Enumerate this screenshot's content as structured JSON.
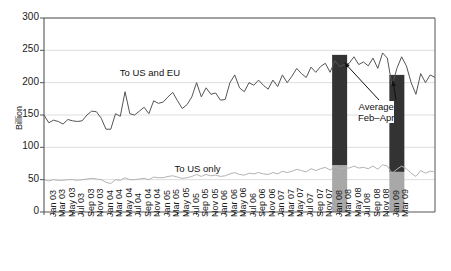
{
  "chart_data": {
    "type": "line",
    "title": "",
    "xlabel": "",
    "ylabel": "Billion",
    "ylim": [
      0,
      300
    ],
    "yticks": [
      0,
      50,
      100,
      150,
      200,
      250,
      300
    ],
    "grid": true,
    "legend_position": "inline-annotation",
    "x_tick_step_months": 2,
    "x": [
      "Jan 03",
      "Mar 03",
      "May 03",
      "Jul 03",
      "Sep 03",
      "Nov 03",
      "Jan 04",
      "Mar 04",
      "May 04",
      "Jul 04",
      "Sep 04",
      "Nov 04",
      "Jan 05",
      "Mar 05",
      "May 05",
      "Jul 05",
      "Sep 05",
      "Nov 05",
      "Jan 06",
      "Mar 06",
      "May 06",
      "Jul 06",
      "Sep 06",
      "Nov 06",
      "Jan 07",
      "Mar 07",
      "May 07",
      "Jul 07",
      "Sep 07",
      "Nov 07",
      "Jan 08",
      "Mar 08",
      "May 08",
      "Jul 08",
      "Sep 08",
      "Nov 08",
      "Jan 09",
      "Mar 09"
    ],
    "series": [
      {
        "name": "To US and EU",
        "color": "#555555",
        "label_x": "Jul 04",
        "monthly_values": [
          150,
          138,
          142,
          140,
          136,
          143,
          141,
          140,
          141,
          150,
          156,
          155,
          145,
          128,
          128,
          152,
          148,
          186,
          152,
          150,
          156,
          162,
          152,
          172,
          168,
          170,
          178,
          185,
          172,
          160,
          166,
          178,
          200,
          178,
          192,
          182,
          184,
          173,
          174,
          200,
          212,
          192,
          186,
          200,
          196,
          204,
          196,
          190,
          204,
          194,
          212,
          200,
          210,
          222,
          214,
          208,
          224,
          216,
          225,
          230,
          216,
          234,
          225,
          228,
          230,
          240,
          228,
          232,
          226,
          238,
          222,
          246,
          238,
          195,
          222,
          240,
          226,
          200,
          182,
          214,
          200,
          212,
          208
        ]
      },
      {
        "name": "To US only",
        "color": "#b3b3b3",
        "label_x": "Sep 05",
        "monthly_values": [
          50,
          48,
          50,
          49,
          49,
          50,
          50,
          49,
          50,
          51,
          52,
          51,
          50,
          46,
          44,
          50,
          49,
          53,
          50,
          50,
          51,
          52,
          50,
          54,
          53,
          53,
          55,
          56,
          54,
          52,
          53,
          55,
          58,
          55,
          58,
          56,
          57,
          55,
          56,
          59,
          61,
          58,
          57,
          60,
          59,
          61,
          59,
          58,
          61,
          59,
          63,
          61,
          63,
          66,
          64,
          62,
          67,
          64,
          67,
          69,
          65,
          70,
          67,
          68,
          68,
          71,
          68,
          69,
          67,
          71,
          66,
          73,
          71,
          60,
          66,
          71,
          67,
          60,
          55,
          64,
          60,
          63,
          62
        ]
      }
    ],
    "bars": [
      {
        "name": "Average Feb-Apr 2008",
        "center_x": "Mar 08",
        "total_value": 243,
        "lower_value": 72,
        "upper_color": "#333333",
        "lower_color": "#a8a8a8"
      },
      {
        "name": "Average Feb-Apr 2009",
        "center_x": "Mar 09",
        "total_value": 212,
        "lower_value": 62,
        "upper_color": "#333333",
        "lower_color": "#a8a8a8"
      }
    ],
    "annotations": [
      {
        "text_line1": "Average",
        "text_line2": "Feb–Apr",
        "target_bars": [
          "Average Feb-Apr 2008",
          "Average Feb-Apr 2009"
        ]
      }
    ],
    "colors": {
      "axis": "#555555",
      "grid": "#dddddd",
      "text": "#1a1a1a",
      "plot_background": "#ffffff"
    }
  }
}
